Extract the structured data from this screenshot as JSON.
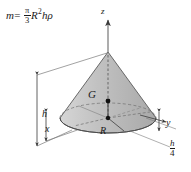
{
  "figure": {
    "equation": {
      "lhs": "m",
      "equals": "=",
      "pi": "π",
      "denominator": "3",
      "radius_symbol": "R",
      "radius_exponent": "2",
      "height_symbol": "h",
      "density_symbol": "ρ",
      "full_text": "m = (π/3)R²hρ"
    },
    "labels": {
      "axis_z": "z",
      "axis_x": "x",
      "axis_y": "y",
      "centroid": "G",
      "radius": "R",
      "height": "h",
      "centroid_height_num": "h",
      "centroid_height_den": "4",
      "centroid_height": "h/4"
    },
    "colors": {
      "cone_fill": "#b9b9b9",
      "cone_fill_light": "#d2d2d2",
      "base_fill": "#c6c6c6",
      "outline": "#4d4d4d",
      "text": "#1a1a1a",
      "background": "#ffffff"
    },
    "geometry": {
      "apex_x": 108,
      "apex_y": 52,
      "base_center_x": 108,
      "base_center_y": 118,
      "base_rx": 48,
      "base_ry": 15,
      "centroid_x": 108,
      "centroid_y": 101
    }
  }
}
